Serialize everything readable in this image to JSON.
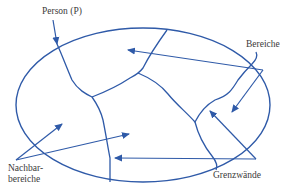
{
  "diagram": {
    "colors": {
      "line": "#2f5aa8",
      "text": "#3a3a3a",
      "background": "#ffffff"
    },
    "labels": {
      "person": "Person (P)",
      "bereiche": "Bereiche",
      "nachbarbereiche_line1": "Nachbar-",
      "nachbarbereiche_line2": "bereiche",
      "grenzwaende": "Grenzwände"
    },
    "shapes": {
      "outer_boundary": "ellipse",
      "internal_boundaries": 4,
      "arrows": 7
    }
  }
}
